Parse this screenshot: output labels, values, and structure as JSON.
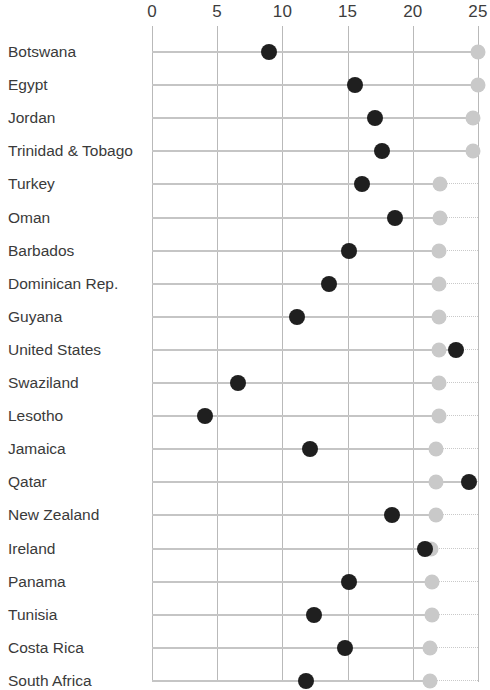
{
  "chart_data": {
    "type": "scatter",
    "subtype": "dumbbell-dot-plot",
    "title": "",
    "subtitle": "",
    "xlabel": "",
    "ylabel": "",
    "xlim": [
      0,
      25
    ],
    "xticks": [
      0,
      5,
      10,
      15,
      20,
      25
    ],
    "xtick_labels": [
      "0",
      "5",
      "10",
      "15",
      "20",
      "25"
    ],
    "grid": true,
    "grid_axis": "x",
    "legend": false,
    "legend_position": "none",
    "orientation": "horizontal",
    "categories": [
      "Botswana",
      "Egypt",
      "Jordan",
      "Trinidad & Tobago",
      "Turkey",
      "Oman",
      "Barbados",
      "Dominican Rep.",
      "Guyana",
      "United States",
      "Swaziland",
      "Lesotho",
      "Jamaica",
      "Qatar",
      "New Zealand",
      "Ireland",
      "Panama",
      "Tunisia",
      "Costa Rica",
      "South Africa"
    ],
    "series": [
      {
        "name": "dark-marker",
        "color": "#1f1f1f",
        "values": [
          9.0,
          15.6,
          17.1,
          17.6,
          16.1,
          18.6,
          15.1,
          13.6,
          11.1,
          23.3,
          6.6,
          4.1,
          12.1,
          24.3,
          18.4,
          20.9,
          15.1,
          12.4,
          14.8,
          11.8
        ]
      },
      {
        "name": "light-marker",
        "color": "#c9c9c9",
        "values": [
          25.0,
          25.0,
          24.6,
          24.6,
          22.1,
          22.1,
          22.0,
          22.0,
          22.0,
          22.0,
          22.0,
          22.0,
          21.8,
          21.8,
          21.8,
          21.4,
          21.5,
          21.5,
          21.3,
          21.3
        ]
      }
    ]
  },
  "axis": {
    "tick_0": "0",
    "tick_5": "5",
    "tick_10": "10",
    "tick_15": "15",
    "tick_20": "20",
    "tick_25": "25"
  },
  "colors": {
    "dark_marker": "#1f1f1f",
    "light_marker": "#c9c9c9",
    "gridline": "#b9b9b9",
    "connector": "#c5c5c5",
    "text": "#3a3a3a",
    "background": "#ffffff"
  }
}
